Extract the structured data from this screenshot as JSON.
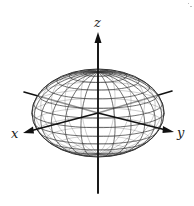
{
  "diagram": {
    "type": "3d-ellipsoid-wireframe",
    "axes": {
      "x": {
        "label": "x"
      },
      "y": {
        "label": "y"
      },
      "z": {
        "label": "z"
      }
    },
    "surface": {
      "shape": "ellipsoid",
      "render": "wireframe mesh",
      "mesh_color": "#333333",
      "fill": "#ffffff"
    },
    "colors": {
      "axis": "#111111",
      "background": "#ffffff"
    }
  }
}
